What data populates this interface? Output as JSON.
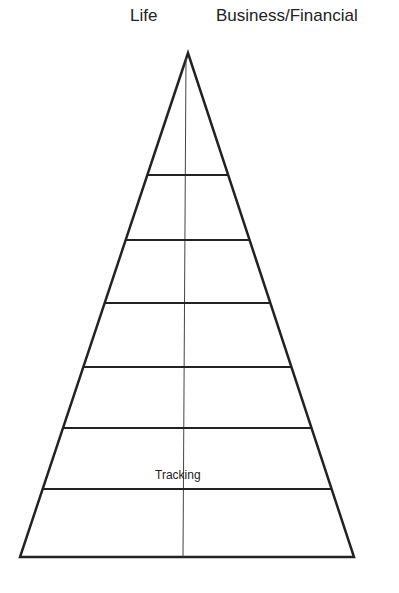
{
  "header": {
    "left_label": "Life",
    "right_label": "Business/Financial"
  },
  "pyramid": {
    "apex": [
      188,
      53
    ],
    "base_left": [
      20,
      557
    ],
    "base_right": [
      354,
      557
    ],
    "center_line_x": 183,
    "level_lines_y": [
      175,
      240,
      303,
      367,
      428,
      489
    ],
    "levels": 7,
    "stroke_color": "#222222"
  },
  "annotations": {
    "tracking_label": "Tracking"
  }
}
